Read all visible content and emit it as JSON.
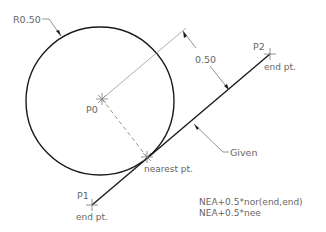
{
  "diagram": {
    "colors": {
      "background": "#ffffff",
      "geometry": "#1a1a1a",
      "annotation": "#777777",
      "text": "#666666"
    },
    "labels": {
      "radius": "R0.50",
      "center_point": "P0",
      "point1": "P1",
      "point2": "P2",
      "endpoint1": "end pt.",
      "endpoint2": "end pt.",
      "nearest": "nearest pt.",
      "dimension": "0.50",
      "given": "Given",
      "formula1": "NEA+0.5*nor(end,end)",
      "formula2": "NEA+0.5*nee"
    },
    "geometry": {
      "circle": {
        "cx": 100,
        "cy": 101,
        "r": 74
      },
      "line": {
        "x1": 92,
        "y1": 205,
        "x2": 270,
        "y2": 54
      },
      "nearest_point": {
        "x": 147,
        "y": 157
      },
      "center": {
        "x": 102,
        "y": 99
      }
    }
  }
}
